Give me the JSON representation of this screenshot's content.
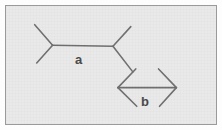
{
  "figure": {
    "name": "muller-lyer-illusion-diagram",
    "background_color": "#e9e9e9",
    "border_color": "#9a9a9a",
    "page_color": "#fdfdfd",
    "stroke_color": "#6e6e6e",
    "label_color": "#474747",
    "shafts": [
      {
        "id": "a",
        "label": "a",
        "label_x": 75,
        "label_y": 53,
        "arrow_style": "outward-fins",
        "x1": 52,
        "y1": 45,
        "x2": 113,
        "y2": 46,
        "fins": [
          {
            "x": 34,
            "y": 24
          },
          {
            "x": 36,
            "y": 63
          },
          {
            "x": 131,
            "y": 26
          },
          {
            "x": 133,
            "y": 72
          }
        ]
      },
      {
        "id": "b",
        "label": "b",
        "label_x": 141,
        "label_y": 95,
        "arrow_style": "inward-fins",
        "x1": 118,
        "y1": 88,
        "x2": 177,
        "y2": 88,
        "fins": [
          {
            "x": 136,
            "y": 69
          },
          {
            "x": 137,
            "y": 107
          },
          {
            "x": 159,
            "y": 69
          },
          {
            "x": 160,
            "y": 107
          }
        ]
      }
    ]
  },
  "chart_data": {
    "type": "diagram",
    "title": "",
    "items": [
      {
        "label": "a",
        "shaft_length_px": 61,
        "fin_direction": "outward",
        "shaft_start": [
          52,
          45
        ],
        "shaft_end": [
          113,
          46
        ]
      },
      {
        "label": "b",
        "shaft_length_px": 59,
        "fin_direction": "inward",
        "shaft_start": [
          118,
          88
        ],
        "shaft_end": [
          177,
          88
        ]
      }
    ],
    "labels": [
      "a",
      "b"
    ]
  }
}
